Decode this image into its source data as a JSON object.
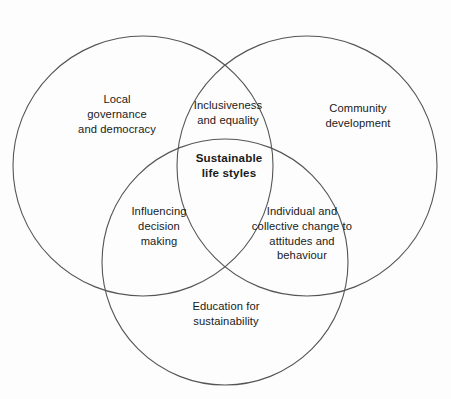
{
  "diagram": {
    "type": "venn-3-circle",
    "background_color": "#fdfdfd",
    "stroke_color": "#555555",
    "text_color": "#1a1a1a",
    "cropped_header_text": "",
    "circles": [
      {
        "id": "local-governance",
        "cx": 143,
        "cy": 166,
        "r": 130
      },
      {
        "id": "community-development",
        "cx": 307,
        "cy": 166,
        "r": 130
      },
      {
        "id": "education-sustainability",
        "cx": 225,
        "cy": 262,
        "r": 123
      }
    ],
    "labels": {
      "left_circle": "Local\ngovernance\nand democracy",
      "right_circle": "Community\ndevelopment",
      "bottom_circle": "Education for\nsustainability",
      "top_intersection": "Inclusiveness\nand equality",
      "left_intersection": "Influencing\ndecision\nmaking",
      "right_intersection": "Individual and\ncollective change to\nattitudes and\nbehaviour",
      "center_intersection": "Sustainable\nlife styles"
    }
  }
}
